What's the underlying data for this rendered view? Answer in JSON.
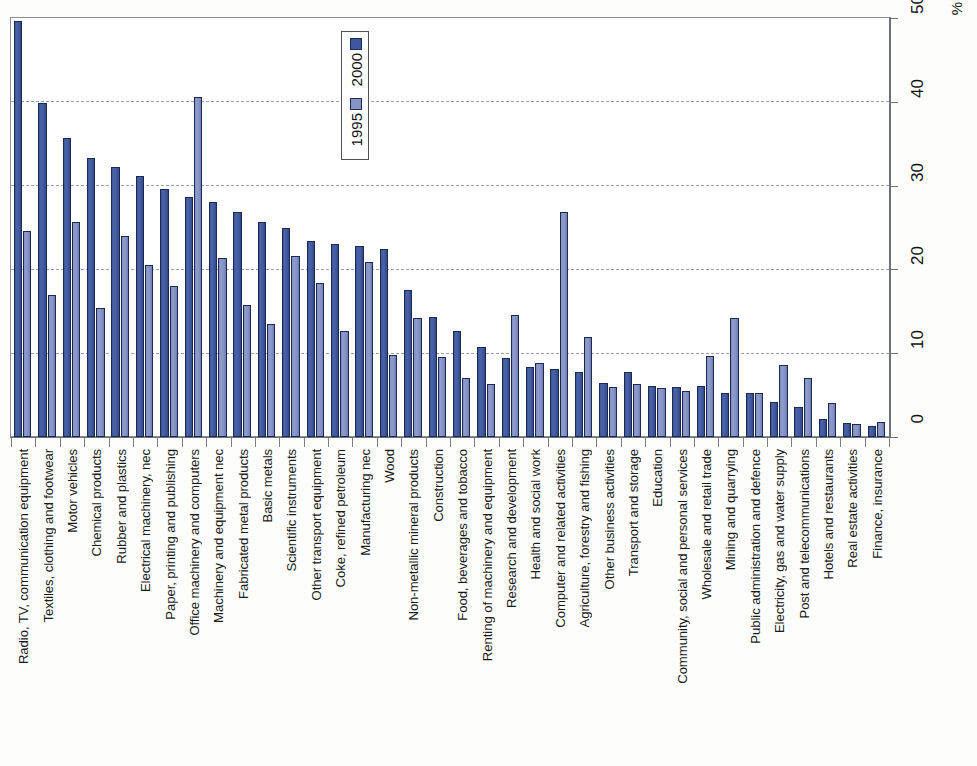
{
  "chart_data": {
    "type": "bar",
    "title": "",
    "subtitle": "",
    "xlabel": "",
    "ylabel": "%",
    "ylim": [
      0,
      50
    ],
    "yticks": [
      0,
      10,
      20,
      30,
      40,
      50
    ],
    "ytick_labels": [
      "0",
      "10",
      "20",
      "30",
      "40",
      "50"
    ],
    "gridlines": [
      10,
      20,
      30,
      40
    ],
    "grid": true,
    "legend_position": "top-center",
    "legend": [
      "1995",
      "2000"
    ],
    "colors": {
      "series_2000": "#41589e",
      "series_1995": "#8694c6",
      "grid": "#9aa0ad",
      "axis": "#6d7276",
      "text": "#111111",
      "background": "#fdfdfb"
    },
    "categories": [
      "Radio, TV, communication equipment",
      "Textiles, clothing and footwear",
      "Motor vehicles",
      "Chemical products",
      "Rubber and plastics",
      "Electrical machinery, nec",
      "Paper, printing and publishing",
      "Office machinery and computers",
      "Machinery and equipment nec",
      "Fabricated metal products",
      "Basic metals",
      "Scientific instruments",
      "Other transport equipment",
      "Coke, refined petroleum",
      "Manufacturing nec",
      "Wood",
      "Non-metallic mineral products",
      "Construction",
      "Food, beverages and tobacco",
      "Renting of machinery and equipment",
      "Research and development",
      "Health and social work",
      "Computer and related activities",
      "Agriculture, forestry and fishing",
      "Other business activities",
      "Transport and storage",
      "Education",
      "Community, social and personal services",
      "Wholesale and retail trade",
      "Mining and quarrying",
      "Public administration and defence",
      "Electricity, gas and water supply",
      "Post and telecommunications",
      "Hotels and restaurants",
      "Real estate activities",
      "Finance, insurance"
    ],
    "series": [
      {
        "name": "2000",
        "values": [
          49.6,
          39.9,
          35.7,
          33.3,
          32.2,
          31.2,
          29.6,
          28.6,
          28.0,
          26.9,
          25.6,
          25.0,
          23.4,
          23.0,
          22.8,
          22.4,
          17.5,
          14.3,
          12.6,
          10.7,
          9.4,
          8.3,
          8.1,
          7.8,
          6.5,
          7.7,
          6.1,
          6.0,
          6.1,
          5.3,
          5.3,
          4.2,
          3.6,
          2.1,
          1.7,
          1.3
        ]
      },
      {
        "name": "1995",
        "values": [
          24.6,
          16.9,
          25.6,
          15.4,
          24.0,
          20.5,
          18.0,
          40.6,
          21.4,
          15.7,
          13.5,
          21.6,
          18.4,
          12.6,
          20.9,
          9.8,
          14.2,
          9.5,
          7.0,
          6.3,
          14.6,
          8.8,
          26.8,
          11.9,
          6.0,
          6.3,
          5.8,
          5.5,
          9.7,
          14.2,
          5.2,
          8.6,
          7.1,
          4.1,
          1.6,
          1.8
        ]
      }
    ]
  },
  "legend": {
    "box_label_1": "1995",
    "box_label_2": "2000"
  },
  "axis": {
    "unit_label": "%"
  }
}
